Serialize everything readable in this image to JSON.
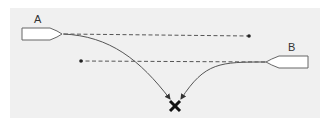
{
  "diagram": {
    "boats": [
      {
        "id": "A",
        "label": "A",
        "heading": "right"
      },
      {
        "id": "B",
        "label": "B",
        "heading": "left"
      }
    ],
    "paths": [
      {
        "from": "A",
        "style": "dashed",
        "meaning": "straight-ahead course",
        "direction": "right"
      },
      {
        "from": "B",
        "style": "dashed",
        "meaning": "straight-ahead course",
        "direction": "left"
      },
      {
        "from": "A",
        "style": "solid",
        "meaning": "curved course to meeting point"
      },
      {
        "from": "B",
        "style": "solid",
        "meaning": "curved course to meeting point"
      }
    ],
    "marker": {
      "symbol": "✕",
      "meaning": "collision / meeting point"
    },
    "colors": {
      "background": "#f0f0f0",
      "line": "#555555",
      "boat_fill": "#ffffff",
      "boat_stroke": "#666666",
      "marker": "#111111"
    }
  }
}
